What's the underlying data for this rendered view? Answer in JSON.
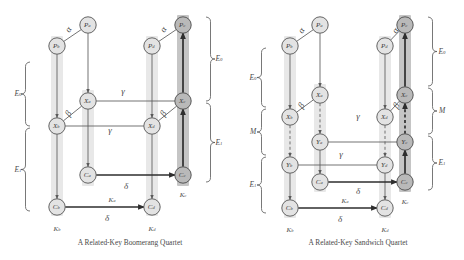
{
  "figure": {
    "panels": [
      {
        "id": "boomerang",
        "caption": "A Related-Key Boomerang Quartet",
        "nodes": [
          {
            "id": "Pa",
            "label": "P",
            "sub": "a",
            "x": 88,
            "y": 25,
            "shade": "light"
          },
          {
            "id": "Pb",
            "label": "P",
            "sub": "b",
            "x": 57,
            "y": 46,
            "shade": "light"
          },
          {
            "id": "Pc",
            "label": "P",
            "sub": "c",
            "x": 183,
            "y": 25,
            "shade": "dark"
          },
          {
            "id": "Pd",
            "label": "P",
            "sub": "d",
            "x": 152,
            "y": 46,
            "shade": "light"
          },
          {
            "id": "Xa",
            "label": "X",
            "sub": "a",
            "x": 88,
            "y": 101,
            "shade": "light"
          },
          {
            "id": "Xb",
            "label": "X",
            "sub": "b",
            "x": 57,
            "y": 126,
            "shade": "light"
          },
          {
            "id": "Xc",
            "label": "X",
            "sub": "c",
            "x": 183,
            "y": 101,
            "shade": "dark"
          },
          {
            "id": "Xd",
            "label": "X",
            "sub": "d",
            "x": 152,
            "y": 126,
            "shade": "light"
          },
          {
            "id": "Ca",
            "label": "C",
            "sub": "a",
            "x": 88,
            "y": 175,
            "shade": "light"
          },
          {
            "id": "Cb",
            "label": "C",
            "sub": "b",
            "x": 57,
            "y": 207,
            "shade": "light"
          },
          {
            "id": "Cc",
            "label": "C",
            "sub": "c",
            "x": 183,
            "y": 175,
            "shade": "dark"
          },
          {
            "id": "Cd",
            "label": "C",
            "sub": "d",
            "x": 152,
            "y": 207,
            "shade": "light"
          }
        ],
        "greek_labels": [
          {
            "text": "α",
            "x": 69,
            "y": 30,
            "rot": -58
          },
          {
            "text": "β",
            "x": 69,
            "y": 114,
            "rot": -58
          },
          {
            "text": "γ",
            "x": 123,
            "y": 92
          },
          {
            "text": "γ",
            "x": 110,
            "y": 131
          },
          {
            "text": "α",
            "x": 164,
            "y": 30,
            "rot": -58
          },
          {
            "text": "β",
            "x": 164,
            "y": 114,
            "rot": -58
          },
          {
            "text": "δ",
            "x": 126,
            "y": 187
          },
          {
            "text": "δ",
            "x": 107,
            "y": 219
          }
        ],
        "key_labels": [
          {
            "label": "K",
            "sub": "a",
            "x": 112,
            "y": 200
          },
          {
            "label": "K",
            "sub": "b",
            "x": 57,
            "y": 229
          },
          {
            "label": "K",
            "sub": "c",
            "x": 183,
            "y": 195
          },
          {
            "label": "K",
            "sub": "d",
            "x": 152,
            "y": 229
          }
        ],
        "braces": [
          {
            "side": "left",
            "x": 30,
            "y1": 62,
            "y2": 126,
            "label": "E",
            "sub": "0",
            "lx": 18,
            "ly": 94
          },
          {
            "side": "left",
            "x": 30,
            "y1": 128,
            "y2": 211,
            "label": "E",
            "sub": "1",
            "lx": 18,
            "ly": 170
          },
          {
            "side": "right",
            "x": 206,
            "y1": 17,
            "y2": 101,
            "label": "E",
            "sub": "0",
            "lx": 219,
            "ly": 59
          },
          {
            "side": "right",
            "x": 206,
            "y1": 103,
            "y2": 182,
            "label": "E",
            "sub": "1",
            "lx": 219,
            "ly": 143
          }
        ]
      },
      {
        "id": "sandwich",
        "caption": "A Related-Key Sandwich Quartet",
        "nodes": [
          {
            "id": "Pa",
            "label": "P",
            "sub": "a",
            "x": 320,
            "y": 25,
            "shade": "light"
          },
          {
            "id": "Pb",
            "label": "P",
            "sub": "b",
            "x": 290,
            "y": 46,
            "shade": "light"
          },
          {
            "id": "Pc",
            "label": "P",
            "sub": "c",
            "x": 405,
            "y": 25,
            "shade": "dark"
          },
          {
            "id": "Pd",
            "label": "P",
            "sub": "d",
            "x": 385,
            "y": 46,
            "shade": "light"
          },
          {
            "id": "Xa",
            "label": "X",
            "sub": "a",
            "x": 320,
            "y": 95,
            "shade": "light"
          },
          {
            "id": "Xb",
            "label": "X",
            "sub": "b",
            "x": 290,
            "y": 117,
            "shade": "light"
          },
          {
            "id": "Xc",
            "label": "X",
            "sub": "c",
            "x": 405,
            "y": 95,
            "shade": "dark"
          },
          {
            "id": "Xd",
            "label": "X",
            "sub": "d",
            "x": 385,
            "y": 117,
            "shade": "light"
          },
          {
            "id": "Ya",
            "label": "Y",
            "sub": "a",
            "x": 320,
            "y": 142,
            "shade": "light"
          },
          {
            "id": "Yb",
            "label": "Y",
            "sub": "b",
            "x": 290,
            "y": 165,
            "shade": "light"
          },
          {
            "id": "Yc",
            "label": "Y",
            "sub": "c",
            "x": 405,
            "y": 142,
            "shade": "dark"
          },
          {
            "id": "Yd",
            "label": "Y",
            "sub": "d",
            "x": 385,
            "y": 165,
            "shade": "light"
          },
          {
            "id": "Ca",
            "label": "C",
            "sub": "a",
            "x": 320,
            "y": 182,
            "shade": "light"
          },
          {
            "id": "Cb",
            "label": "C",
            "sub": "b",
            "x": 290,
            "y": 208,
            "shade": "light"
          },
          {
            "id": "Cc",
            "label": "C",
            "sub": "c",
            "x": 405,
            "y": 182,
            "shade": "dark"
          },
          {
            "id": "Cd",
            "label": "C",
            "sub": "d",
            "x": 385,
            "y": 208,
            "shade": "light"
          }
        ],
        "greek_labels": [
          {
            "text": "α",
            "x": 302,
            "y": 31,
            "rot": -58
          },
          {
            "text": "β",
            "x": 302,
            "y": 106,
            "rot": -58
          },
          {
            "text": "γ",
            "x": 358,
            "y": 117
          },
          {
            "text": "γ",
            "x": 341,
            "y": 155
          },
          {
            "text": "α",
            "x": 396,
            "y": 31,
            "rot": -58
          },
          {
            "text": "β",
            "x": 397,
            "y": 106,
            "rot": -58
          },
          {
            "text": "δ",
            "x": 358,
            "y": 192
          },
          {
            "text": "δ",
            "x": 340,
            "y": 220
          }
        ],
        "key_labels": [
          {
            "label": "K",
            "sub": "a",
            "x": 345,
            "y": 201
          },
          {
            "label": "K",
            "sub": "b",
            "x": 290,
            "y": 230
          },
          {
            "label": "K",
            "sub": "c",
            "x": 405,
            "y": 202
          },
          {
            "label": "K",
            "sub": "d",
            "x": 385,
            "y": 230
          }
        ],
        "braces": [
          {
            "side": "left",
            "x": 266,
            "y1": 48,
            "y2": 107,
            "label": "E",
            "sub": "0",
            "lx": 253,
            "ly": 78
          },
          {
            "side": "left",
            "x": 266,
            "y1": 109,
            "y2": 155,
            "label": "M",
            "sub": "",
            "lx": 253,
            "ly": 132
          },
          {
            "side": "left",
            "x": 266,
            "y1": 157,
            "y2": 213,
            "label": "E",
            "sub": "1",
            "lx": 253,
            "ly": 185
          },
          {
            "side": "right",
            "x": 428,
            "y1": 17,
            "y2": 86,
            "label": "E",
            "sub": "0",
            "lx": 442,
            "ly": 52
          },
          {
            "side": "right",
            "x": 428,
            "y1": 88,
            "y2": 134,
            "label": "M",
            "sub": "",
            "lx": 442,
            "ly": 111
          },
          {
            "side": "right",
            "x": 428,
            "y1": 136,
            "y2": 190,
            "label": "E",
            "sub": "1",
            "lx": 442,
            "ly": 163
          }
        ]
      }
    ],
    "colors": {
      "node_light": "#e3e3e3",
      "node_dark": "#b9b9b9",
      "band_light": "#e7e7e7",
      "band_dark": "#c2c2c2",
      "edge": "#5a5a5a",
      "edge_thick": "#2e2e2e",
      "text": "#4a4a4a"
    }
  }
}
